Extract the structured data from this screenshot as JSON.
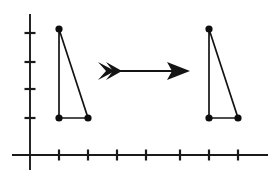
{
  "figure": {
    "background_color": "#ffffff",
    "ink_color": "#141414",
    "width": 275,
    "height": 177
  },
  "axes": {
    "name": "coordinate-axes",
    "x_axis": {
      "label": "x-axis",
      "y_position": 155,
      "x_start": 12,
      "x_end": 268,
      "tick_length": 11,
      "tick_positions": [
        59,
        88,
        117,
        146,
        180,
        209,
        238
      ],
      "tick_count": 7
    },
    "y_axis": {
      "label": "y-axis",
      "x_position": 30,
      "y_start": 14,
      "y_end": 170,
      "tick_length": 11,
      "tick_positions": [
        33,
        62,
        89,
        118
      ],
      "tick_count": 4
    },
    "origin": {
      "x": 30,
      "y": 155
    }
  },
  "shapes": {
    "preimage": {
      "name": "triangle-preimage",
      "label": "original triangle",
      "vertices": [
        {
          "name": "apex",
          "x": 59,
          "y": 29
        },
        {
          "name": "bottom-left",
          "x": 59,
          "y": 118
        },
        {
          "name": "bottom-right",
          "x": 88,
          "y": 118
        }
      ],
      "points_string": "59,29 59,118 88,118",
      "vertex_dot_radius": 3.6
    },
    "image": {
      "name": "triangle-image",
      "label": "translated triangle",
      "vertices": [
        {
          "name": "apex",
          "x": 209,
          "y": 29
        },
        {
          "name": "bottom-left",
          "x": 209,
          "y": 118
        },
        {
          "name": "bottom-right",
          "x": 238,
          "y": 118
        }
      ],
      "points_string": "209,29 209,118 238,118",
      "vertex_dot_radius": 3.6
    }
  },
  "arrow": {
    "name": "translation-arrow",
    "label": "translation direction",
    "direction": "right",
    "shaft": {
      "x1": 110,
      "y1": 71,
      "x2": 180,
      "y2": 71
    },
    "head_points": "190,71 167,62 172,71 167,80",
    "tail_points": "98,62 115,71 98,80 106,71",
    "tail_notch_points": "106,62 122,71 106,80 113,71",
    "translation_vector_px": 150
  }
}
